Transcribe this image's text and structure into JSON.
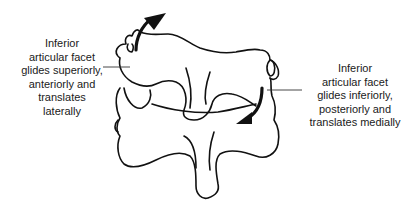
{
  "diagram": {
    "type": "anatomical-illustration",
    "left_label": {
      "lines": [
        "Inferior",
        "articular facet",
        "glides superiorly,",
        "anteriorly and",
        "translates",
        "laterally"
      ]
    },
    "right_label": {
      "lines": [
        "Inferior",
        "articular facet",
        "glides inferiorly,",
        "posteriorly and",
        "translates medially"
      ]
    },
    "arrows": [
      {
        "name": "upward-curved-arrow",
        "direction": "superior-anterior"
      },
      {
        "name": "downward-curved-arrow",
        "direction": "inferior-posterior"
      }
    ],
    "colors": {
      "line": "#111111",
      "text": "#1a1a1a",
      "background": "#ffffff"
    }
  }
}
